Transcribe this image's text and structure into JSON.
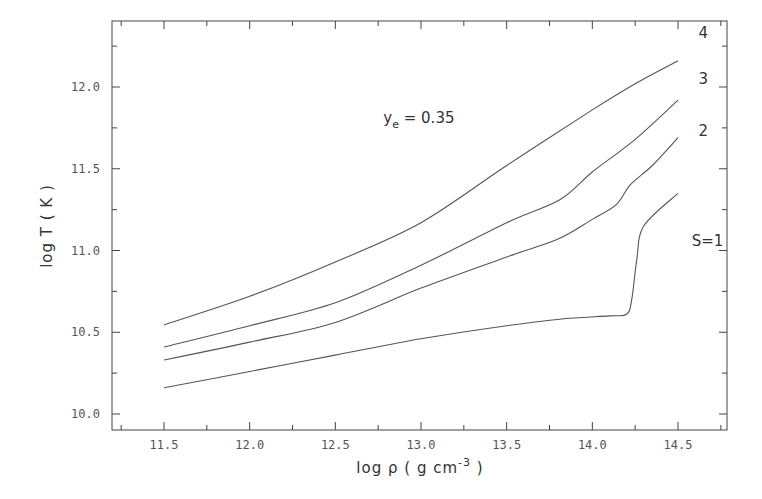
{
  "chart_data": {
    "type": "line",
    "title": "",
    "annotation": {
      "text_main": "y",
      "text_sub": "e",
      "text_rest": " = 0.35",
      "x": 12.78,
      "y": 11.78
    },
    "xlabel": {
      "text": "log ρ ( g cm",
      "sup": "-3",
      "close": " )"
    },
    "ylabel": "log T ( K )",
    "xlim": [
      11.2,
      14.8
    ],
    "ylim": [
      9.9,
      12.45
    ],
    "xticks": [
      11.5,
      12.0,
      12.5,
      13.0,
      13.5,
      14.0,
      14.5
    ],
    "xtick_labels": [
      "11.5",
      "12.0",
      "12.5",
      "13.0",
      "13.5",
      "14.0",
      "14.5"
    ],
    "yticks": [
      10.0,
      10.5,
      11.0,
      11.5,
      12.0
    ],
    "ytick_labels": [
      "10.0",
      "10.5",
      "11.0",
      "11.5",
      "12.0"
    ],
    "grid": false,
    "legend": "inline curve labels at right end",
    "series": [
      {
        "name": "S=1",
        "label": "S=1",
        "x": [
          11.5,
          12.0,
          12.5,
          13.0,
          13.5,
          13.81,
          14.1,
          14.2,
          14.23,
          14.26,
          14.3,
          14.5
        ],
        "y": [
          10.16,
          10.26,
          10.36,
          10.46,
          10.54,
          10.58,
          10.6,
          10.61,
          10.7,
          10.95,
          11.15,
          11.35
        ],
        "label_pos": [
          14.58,
          11.03
        ]
      },
      {
        "name": "S=2",
        "label": "2",
        "x": [
          11.5,
          12.0,
          12.5,
          13.0,
          13.5,
          13.8,
          14.0,
          14.14,
          14.22,
          14.35,
          14.5
        ],
        "y": [
          10.33,
          10.44,
          10.56,
          10.77,
          10.96,
          11.07,
          11.19,
          11.28,
          11.4,
          11.52,
          11.69
        ],
        "label_pos": [
          14.62,
          11.7
        ]
      },
      {
        "name": "S=3",
        "label": "3",
        "x": [
          11.5,
          12.0,
          12.5,
          13.0,
          13.5,
          13.81,
          14.0,
          14.25,
          14.5
        ],
        "y": [
          10.41,
          10.54,
          10.68,
          10.91,
          11.17,
          11.31,
          11.48,
          11.68,
          11.92
        ],
        "label_pos": [
          14.62,
          12.02
        ]
      },
      {
        "name": "S=4",
        "label": "4",
        "x": [
          11.5,
          12.0,
          12.5,
          13.0,
          13.5,
          14.0,
          14.25,
          14.5
        ],
        "y": [
          10.545,
          10.72,
          10.93,
          11.17,
          11.52,
          11.86,
          12.02,
          12.16
        ],
        "label_pos": [
          14.62,
          12.3
        ]
      }
    ],
    "colors": {
      "frame": "#444444",
      "curve": "#555555",
      "text": "#333333"
    }
  },
  "plot_area": {
    "left": 112,
    "top": 21,
    "right": 727,
    "bottom": 430
  }
}
